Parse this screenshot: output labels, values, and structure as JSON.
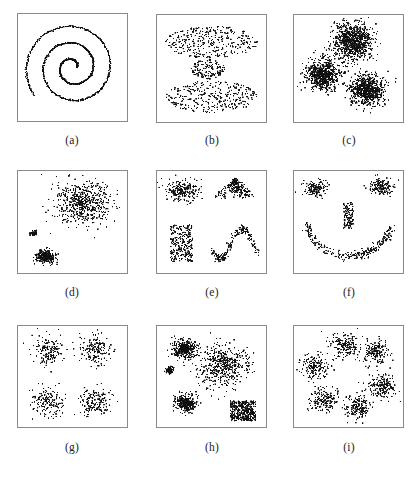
{
  "figure": {
    "title": "",
    "background_color": "#ffffff",
    "point_color": "#101010",
    "border_color": "#8a8a8a",
    "width": 419,
    "height": 483,
    "columns": 3,
    "rows": 3
  },
  "panels": [
    {
      "id": "a",
      "label": "(a)",
      "caption": "Spiral",
      "box": {
        "x": 17,
        "y": 13,
        "w": 111,
        "h": 109
      },
      "label_pos": {
        "x": 52,
        "y": 134
      },
      "chart_data": {
        "type": "scatter",
        "title": "(a) spiral",
        "xlabel": "",
        "ylabel": "",
        "xlim": [
          0,
          1
        ],
        "ylim": [
          0,
          1
        ],
        "grid": false,
        "legend": "none",
        "point_count": 900,
        "clusters": [
          {
            "name": "spiral-arm",
            "shape": "spiral",
            "points": 900,
            "cx": 0.5,
            "cy": 0.5,
            "turns": 2.6,
            "r_start": 0.04,
            "r_end": 0.47,
            "theta_start": 0.0,
            "jitter": 0.004
          }
        ]
      }
    },
    {
      "id": "b",
      "label": "(b)",
      "caption": "Three horizontal bands",
      "box": {
        "x": 156,
        "y": 14,
        "w": 111,
        "h": 109
      },
      "label_pos": {
        "x": 192,
        "y": 134
      },
      "chart_data": {
        "type": "scatter",
        "title": "(b) three elongated bands",
        "xlabel": "",
        "ylabel": "",
        "xlim": [
          0,
          1
        ],
        "ylim": [
          0,
          1
        ],
        "grid": false,
        "legend": "none",
        "point_count": 800,
        "clusters": [
          {
            "name": "top-band",
            "shape": "ellipse-uniform",
            "points": 330,
            "cx": 0.5,
            "cy": 0.765,
            "rx": 0.455,
            "ry": 0.165
          },
          {
            "name": "middle-band",
            "shape": "ellipse-uniform",
            "points": 150,
            "cx": 0.47,
            "cy": 0.492,
            "rx": 0.175,
            "ry": 0.098
          },
          {
            "name": "bottom-band",
            "shape": "ellipse-uniform",
            "points": 320,
            "cx": 0.5,
            "cy": 0.215,
            "rx": 0.45,
            "ry": 0.16
          }
        ]
      }
    },
    {
      "id": "c",
      "label": "(c)",
      "caption": "Three dense Gaussian blobs",
      "box": {
        "x": 293,
        "y": 14,
        "w": 111,
        "h": 109
      },
      "label_pos": {
        "x": 329,
        "y": 134
      },
      "chart_data": {
        "type": "scatter",
        "title": "(c) three compact gaussian clusters",
        "xlabel": "",
        "ylabel": "",
        "xlim": [
          0,
          1
        ],
        "ylim": [
          0,
          1
        ],
        "grid": false,
        "legend": "none",
        "point_count": 2400,
        "clusters": [
          {
            "name": "top-blob",
            "shape": "gaussian",
            "points": 900,
            "cx": 0.545,
            "cy": 0.775,
            "sx": 0.095,
            "sy": 0.09
          },
          {
            "name": "left-blob",
            "shape": "gaussian",
            "points": 750,
            "cx": 0.255,
            "cy": 0.44,
            "sx": 0.082,
            "sy": 0.078
          },
          {
            "name": "right-blob",
            "shape": "gaussian",
            "points": 750,
            "cx": 0.685,
            "cy": 0.285,
            "sx": 0.085,
            "sy": 0.078
          }
        ]
      }
    },
    {
      "id": "d",
      "label": "(d)",
      "caption": "One diffuse cluster with two compact clusters",
      "box": {
        "x": 17,
        "y": 170,
        "w": 111,
        "h": 104
      },
      "label_pos": {
        "x": 52,
        "y": 286
      },
      "chart_data": {
        "type": "scatter",
        "title": "(d) different-density clusters",
        "xlabel": "",
        "ylabel": "",
        "xlim": [
          0,
          1
        ],
        "ylim": [
          0,
          1
        ],
        "grid": false,
        "legend": "none",
        "point_count": 900,
        "clusters": [
          {
            "name": "large-diffuse-cluster",
            "shape": "gaussian",
            "points": 560,
            "cx": 0.6,
            "cy": 0.7,
            "sx": 0.135,
            "sy": 0.11
          },
          {
            "name": "compact-cluster",
            "shape": "gaussian",
            "points": 280,
            "cx": 0.235,
            "cy": 0.135,
            "sx": 0.048,
            "sy": 0.032
          },
          {
            "name": "tiny-dense-dot",
            "shape": "gaussian",
            "points": 60,
            "cx": 0.12,
            "cy": 0.38,
            "sx": 0.016,
            "sy": 0.014
          }
        ]
      }
    },
    {
      "id": "e",
      "label": "(e)",
      "caption": "Four differently shaped clusters",
      "box": {
        "x": 156,
        "y": 170,
        "w": 111,
        "h": 104
      },
      "label_pos": {
        "x": 192,
        "y": 286
      },
      "chart_data": {
        "type": "scatter",
        "title": "(e) arbitrary-shape clusters",
        "xlabel": "",
        "ylabel": "",
        "xlim": [
          0,
          1
        ],
        "ylim": [
          0,
          1
        ],
        "grid": false,
        "legend": "none",
        "point_count": 900,
        "clusters": [
          {
            "name": "top-left-gaussian-blob",
            "shape": "gaussian",
            "points": 230,
            "cx": 0.215,
            "cy": 0.83,
            "sx": 0.08,
            "sy": 0.058
          },
          {
            "name": "top-right-triangle-peak",
            "shape": "triangle",
            "points": 230,
            "cx": 0.735,
            "cy": 0.855,
            "half_width": 0.225,
            "height": 0.195
          },
          {
            "name": "bottom-left-rectangle",
            "shape": "rect-uniform",
            "points": 260,
            "cx": 0.205,
            "cy": 0.275,
            "w": 0.225,
            "h": 0.39
          },
          {
            "name": "bottom-right-sine-curve",
            "shape": "sine",
            "points": 200,
            "x0": 0.5,
            "x1": 0.965,
            "y_mid": 0.27,
            "amp": 0.155,
            "phase": 3.55,
            "cycles": 1.05,
            "jitter": 0.022
          }
        ]
      }
    },
    {
      "id": "f",
      "label": "(f)",
      "caption": "Smiley face: two eyes, a nose and a smile",
      "box": {
        "x": 293,
        "y": 170,
        "w": 111,
        "h": 104
      },
      "label_pos": {
        "x": 329,
        "y": 286
      },
      "chart_data": {
        "type": "scatter",
        "title": "(f) smiley-face dataset",
        "xlabel": "",
        "ylabel": "",
        "xlim": [
          0,
          1
        ],
        "ylim": [
          0,
          1
        ],
        "grid": false,
        "legend": "none",
        "point_count": 700,
        "clusters": [
          {
            "name": "left-eye",
            "shape": "gaussian",
            "points": 150,
            "cx": 0.175,
            "cy": 0.855,
            "sx": 0.06,
            "sy": 0.045
          },
          {
            "name": "right-eye",
            "shape": "gaussian",
            "points": 150,
            "cx": 0.83,
            "cy": 0.865,
            "sx": 0.058,
            "sy": 0.042
          },
          {
            "name": "nose",
            "shape": "rect-uniform",
            "points": 130,
            "cx": 0.5,
            "cy": 0.57,
            "w": 0.095,
            "h": 0.275
          },
          {
            "name": "smile-arc",
            "shape": "arc",
            "points": 280,
            "cx": 0.505,
            "cy": 0.56,
            "rx": 0.43,
            "ry": 0.415,
            "theta_start": 193,
            "theta_end": 347,
            "jitter": 0.022
          }
        ]
      }
    },
    {
      "id": "g",
      "label": "(g)",
      "caption": "Four well-separated equal clusters",
      "box": {
        "x": 17,
        "y": 325,
        "w": 111,
        "h": 103
      },
      "label_pos": {
        "x": 52,
        "y": 441
      },
      "chart_data": {
        "type": "scatter",
        "title": "(g) four equal gaussian clusters",
        "xlabel": "",
        "ylabel": "",
        "xlim": [
          0,
          1
        ],
        "ylim": [
          0,
          1
        ],
        "grid": false,
        "legend": "none",
        "point_count": 640,
        "clusters": [
          {
            "name": "top-left-cluster",
            "shape": "gaussian",
            "points": 160,
            "cx": 0.265,
            "cy": 0.775,
            "sx": 0.08,
            "sy": 0.08
          },
          {
            "name": "top-right-cluster",
            "shape": "gaussian",
            "points": 160,
            "cx": 0.73,
            "cy": 0.775,
            "sx": 0.08,
            "sy": 0.08
          },
          {
            "name": "bottom-left-cluster",
            "shape": "gaussian",
            "points": 160,
            "cx": 0.265,
            "cy": 0.235,
            "sx": 0.08,
            "sy": 0.08
          },
          {
            "name": "bottom-right-cluster",
            "shape": "gaussian",
            "points": 160,
            "cx": 0.73,
            "cy": 0.235,
            "sx": 0.08,
            "sy": 0.08
          }
        ]
      }
    },
    {
      "id": "h",
      "label": "(h)",
      "caption": "Mixed densities, shapes and sizes",
      "box": {
        "x": 156,
        "y": 325,
        "w": 111,
        "h": 103
      },
      "label_pos": {
        "x": 192,
        "y": 441
      },
      "chart_data": {
        "type": "scatter",
        "title": "(h) mixed density and shape clusters",
        "xlabel": "",
        "ylabel": "",
        "xlim": [
          0,
          1
        ],
        "ylim": [
          0,
          1
        ],
        "grid": false,
        "legend": "none",
        "point_count": 1500,
        "clusters": [
          {
            "name": "top-left-dense-blob",
            "shape": "gaussian",
            "points": 380,
            "cx": 0.23,
            "cy": 0.79,
            "sx": 0.058,
            "sy": 0.05
          },
          {
            "name": "small-dense-dot",
            "shape": "gaussian",
            "points": 90,
            "cx": 0.085,
            "cy": 0.565,
            "sx": 0.022,
            "sy": 0.02
          },
          {
            "name": "large-diffuse-cluster",
            "shape": "gaussian",
            "points": 480,
            "cx": 0.62,
            "cy": 0.62,
            "sx": 0.12,
            "sy": 0.115
          },
          {
            "name": "bottom-left-dense-blob",
            "shape": "gaussian",
            "points": 300,
            "cx": 0.25,
            "cy": 0.215,
            "sx": 0.055,
            "sy": 0.048
          },
          {
            "name": "bottom-right-dense-square",
            "shape": "rect-uniform",
            "points": 420,
            "cx": 0.81,
            "cy": 0.135,
            "w": 0.25,
            "h": 0.215
          }
        ]
      }
    },
    {
      "id": "i",
      "label": "(i)",
      "caption": "Six clusters arranged in a ring",
      "box": {
        "x": 293,
        "y": 325,
        "w": 111,
        "h": 103
      },
      "label_pos": {
        "x": 329,
        "y": 441
      },
      "chart_data": {
        "type": "scatter",
        "title": "(i) six clusters in a ring",
        "xlabel": "",
        "ylabel": "",
        "xlim": [
          0,
          1
        ],
        "ylim": [
          0,
          1
        ],
        "grid": false,
        "legend": "none",
        "point_count": 1020,
        "clusters": [
          {
            "name": "cluster-top",
            "shape": "gaussian",
            "points": 180,
            "cx": 0.46,
            "cy": 0.83,
            "sx": 0.072,
            "sy": 0.068
          },
          {
            "name": "cluster-top-right",
            "shape": "gaussian",
            "points": 170,
            "cx": 0.765,
            "cy": 0.76,
            "sx": 0.066,
            "sy": 0.062
          },
          {
            "name": "cluster-left",
            "shape": "gaussian",
            "points": 170,
            "cx": 0.175,
            "cy": 0.6,
            "sx": 0.07,
            "sy": 0.062
          },
          {
            "name": "cluster-right",
            "shape": "gaussian",
            "points": 175,
            "cx": 0.83,
            "cy": 0.4,
            "sx": 0.07,
            "sy": 0.066
          },
          {
            "name": "cluster-bottom-left",
            "shape": "gaussian",
            "points": 175,
            "cx": 0.255,
            "cy": 0.245,
            "sx": 0.07,
            "sy": 0.065
          },
          {
            "name": "cluster-bottom",
            "shape": "gaussian",
            "points": 175,
            "cx": 0.59,
            "cy": 0.18,
            "sx": 0.07,
            "sy": 0.066
          }
        ]
      }
    }
  ]
}
